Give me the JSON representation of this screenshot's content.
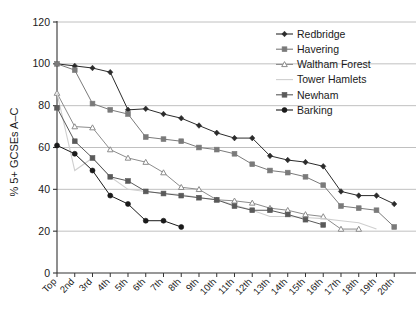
{
  "chart_data": {
    "type": "line",
    "title": "",
    "subtitle": "",
    "xlabel": "",
    "ylabel": "% 5+ GCSEs A–C",
    "ylim": [
      0,
      120
    ],
    "yticks": [
      0,
      20,
      40,
      60,
      80,
      100,
      120
    ],
    "grid": true,
    "legend_position": "top-right",
    "categories": [
      "Top",
      "2nd",
      "3rd",
      "4th",
      "5th",
      "6th",
      "7th",
      "8th",
      "9th",
      "10th",
      "11th",
      "12th",
      "13th",
      "14th",
      "15th",
      "16th",
      "17th",
      "18th",
      "19th",
      "20th"
    ],
    "series": [
      {
        "name": "Redbridge",
        "color": "#2b2b2b",
        "marker": "diamond",
        "values": [
          100,
          99,
          98,
          96,
          78,
          78.5,
          76,
          74,
          70.5,
          67,
          64.5,
          64.5,
          56,
          54,
          53,
          51,
          39,
          37,
          37,
          33
        ]
      },
      {
        "name": "Havering",
        "color": "#7a7a7a",
        "marker": "square",
        "values": [
          100,
          97,
          81,
          78,
          76,
          65,
          64,
          63,
          60,
          59,
          57,
          52,
          49,
          48,
          46,
          42,
          32,
          31,
          30,
          22
        ]
      },
      {
        "name": "Waltham Forest",
        "color": "#8c8c8c",
        "marker": "triangle",
        "values": [
          86,
          70,
          69.5,
          59,
          55,
          53,
          48,
          41,
          40,
          35,
          34.5,
          33.5,
          31,
          30,
          28,
          27,
          21,
          21,
          null,
          null
        ]
      },
      {
        "name": "Tower Hamlets",
        "color": "#cfcfcf",
        "marker": "none",
        "values": [
          86,
          49,
          55,
          46,
          40,
          39,
          38,
          37.5,
          36,
          35,
          32.5,
          30,
          27,
          27,
          26.5,
          26,
          25,
          24,
          21,
          null
        ]
      },
      {
        "name": "Newham",
        "color": "#5a5a5a",
        "marker": "square",
        "values": [
          79,
          63,
          55,
          46,
          44,
          39,
          38,
          37,
          36,
          35,
          32,
          30,
          30,
          28,
          25.5,
          23,
          null,
          null,
          null,
          null
        ]
      },
      {
        "name": "Barking",
        "color": "#1a1a1a",
        "marker": "circle",
        "values": [
          61,
          57,
          49,
          37,
          33,
          25,
          25,
          22,
          null,
          null,
          null,
          null,
          null,
          null,
          null,
          null,
          null,
          null,
          null,
          null
        ]
      }
    ]
  },
  "legend": {
    "items": [
      {
        "label": "Redbridge"
      },
      {
        "label": "Havering"
      },
      {
        "label": "Waltham Forest"
      },
      {
        "label": "Tower Hamlets"
      },
      {
        "label": "Newham"
      },
      {
        "label": "Barking"
      }
    ]
  }
}
